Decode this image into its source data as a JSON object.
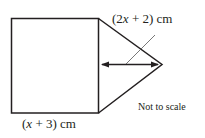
{
  "diagram": {
    "shapes": [
      "square",
      "triangle"
    ],
    "labels": {
      "height_label_pre": "(2",
      "height_label_var": "x",
      "height_label_post": " + 2) cm",
      "base_label_pre": "(",
      "base_label_var": "x",
      "base_label_post": " + 3) cm",
      "note": "Not to scale"
    },
    "colors": {
      "stroke": "#231f20",
      "leader": "#555555",
      "background": "#ffffff"
    }
  }
}
